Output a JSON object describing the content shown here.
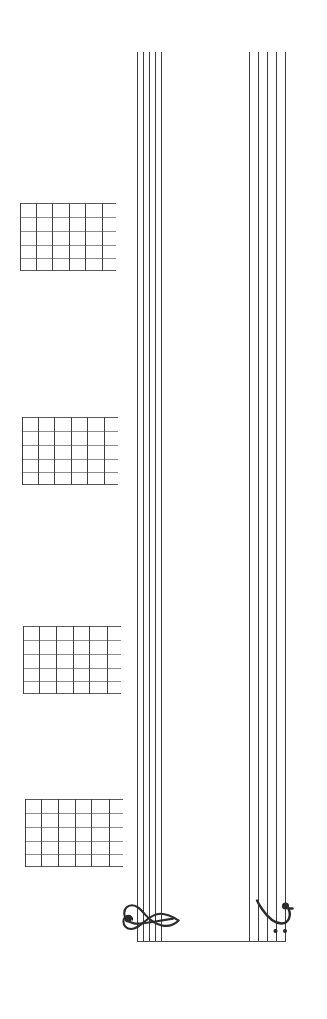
{
  "page": {
    "width": 327,
    "height": 1019,
    "background_color": "#ffffff",
    "ink_color": "#3b3b3b",
    "orientation": "rotated-90"
  },
  "score": {
    "systems": [
      {
        "name": "treble-staff",
        "clef": "treble-clef",
        "clef_symbol": "G",
        "line_count": 5,
        "line_positions_x": [
          137,
          143,
          149,
          155,
          161
        ],
        "start_y": 52,
        "end_y": 941,
        "line_color": "#3b3b3b"
      },
      {
        "name": "bass-staff",
        "clef": "bass-clef",
        "clef_symbol": "F",
        "line_count": 5,
        "line_positions_x": [
          249,
          258,
          267,
          276,
          285
        ],
        "start_y": 52,
        "end_y": 941,
        "line_color": "#3b3b3b"
      }
    ],
    "barline": {
      "name": "system-barline",
      "x_start": 137,
      "x_end": 286,
      "y": 941,
      "color": "#4a4a4a"
    }
  },
  "chord_diagrams": [
    {
      "name": "chord-diagram-1",
      "index": 1,
      "x": 20,
      "y": 203,
      "width": 96,
      "height": 68,
      "strings": 6,
      "frets": 5
    },
    {
      "name": "chord-diagram-2",
      "index": 2,
      "x": 22,
      "y": 417,
      "width": 96,
      "height": 68,
      "strings": 6,
      "frets": 5
    },
    {
      "name": "chord-diagram-3",
      "index": 3,
      "x": 23,
      "y": 626,
      "width": 98,
      "height": 68,
      "strings": 6,
      "frets": 5
    },
    {
      "name": "chord-diagram-4",
      "index": 4,
      "x": 25,
      "y": 799,
      "width": 98,
      "height": 68,
      "strings": 6,
      "frets": 5
    }
  ]
}
